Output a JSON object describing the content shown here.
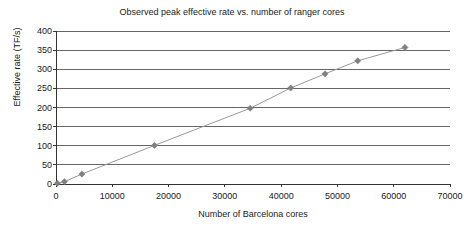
{
  "chart_data": {
    "type": "line",
    "title": "Observed peak effective rate vs. number of ranger cores",
    "xlabel": "Number of Barcelona cores",
    "ylabel": "Effective rate (TF/s)",
    "xlim": [
      0,
      70000
    ],
    "ylim": [
      0,
      400
    ],
    "xticks": [
      0,
      10000,
      20000,
      30000,
      40000,
      50000,
      60000,
      70000
    ],
    "yticks": [
      0,
      50,
      100,
      150,
      200,
      250,
      300,
      350,
      400
    ],
    "xtick_labels": [
      "0",
      "10000",
      "20000",
      "30000",
      "40000",
      "50000",
      "60000",
      "70000"
    ],
    "ytick_labels": [
      "0",
      "50",
      "100",
      "150",
      "200",
      "250",
      "300",
      "350",
      "400"
    ],
    "grid": "horizontal",
    "legend": "none",
    "marker": "diamond",
    "series": [
      {
        "name": "Observed peak effective rate",
        "color": "#808080",
        "points": [
          {
            "x": 250,
            "y": 2
          },
          {
            "x": 1500,
            "y": 6
          },
          {
            "x": 4600,
            "y": 26
          },
          {
            "x": 17500,
            "y": 101
          },
          {
            "x": 34500,
            "y": 198
          },
          {
            "x": 41700,
            "y": 251
          },
          {
            "x": 47800,
            "y": 288
          },
          {
            "x": 53600,
            "y": 322
          },
          {
            "x": 62000,
            "y": 357
          }
        ]
      }
    ],
    "colors": {
      "marker": "#808080",
      "line": "#999999",
      "grid": "#666666",
      "axis": "#333333",
      "background": "#ffffff",
      "text": "#1a1a1a"
    }
  },
  "plot_geometry": {
    "left": 56,
    "right": 450,
    "top": 31,
    "bottom": 184
  }
}
